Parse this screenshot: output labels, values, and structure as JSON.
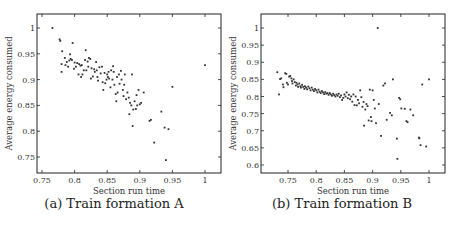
{
  "figure": {
    "captions": [
      "(a) Train formation A",
      "(b) Train formation B"
    ]
  },
  "chart_data": [
    {
      "type": "scatter",
      "title": "(a) Train formation A",
      "xlabel": "Section run time",
      "ylabel": "Average energy consumed",
      "xlim": [
        0.742,
        1.025
      ],
      "ylim": [
        0.72,
        1.027
      ],
      "xticks": [
        0.75,
        0.8,
        0.85,
        0.9,
        0.95,
        1
      ],
      "xtick_labels": [
        "0.75",
        "0.8",
        "0.85",
        "0.9",
        "0.95",
        "1"
      ],
      "yticks": [
        0.75,
        0.8,
        0.85,
        0.9,
        0.95,
        1
      ],
      "ytick_labels": [
        "0.75",
        "0.8",
        "0.85",
        "0.9",
        "0.95",
        "1"
      ],
      "grid": false,
      "legend": null,
      "frame": {
        "left": 37,
        "top": 14,
        "right": 221,
        "bottom": 173
      },
      "pixel_map": {
        "x0": 0.75,
        "px0": 42,
        "x1": 1.0,
        "px1": 205,
        "y0": 0.75,
        "py0": 157,
        "y1": 1.0,
        "py1": 28
      },
      "points": [
        [
          0.766,
          1.0
        ],
        [
          0.777,
          0.978
        ],
        [
          0.778,
          0.975
        ],
        [
          0.781,
          0.955
        ],
        [
          0.78,
          0.93
        ],
        [
          0.78,
          0.915
        ],
        [
          0.785,
          0.942
        ],
        [
          0.786,
          0.928
        ],
        [
          0.788,
          0.934
        ],
        [
          0.79,
          0.925
        ],
        [
          0.792,
          0.937
        ],
        [
          0.793,
          0.949
        ],
        [
          0.794,
          0.94
        ],
        [
          0.796,
          0.938
        ],
        [
          0.797,
          0.971
        ],
        [
          0.799,
          0.921
        ],
        [
          0.8,
          0.933
        ],
        [
          0.802,
          0.925
        ],
        [
          0.804,
          0.932
        ],
        [
          0.806,
          0.91
        ],
        [
          0.807,
          0.93
        ],
        [
          0.809,
          0.927
        ],
        [
          0.81,
          0.905
        ],
        [
          0.811,
          0.928
        ],
        [
          0.812,
          0.91
        ],
        [
          0.814,
          0.918
        ],
        [
          0.816,
          0.938
        ],
        [
          0.817,
          0.957
        ],
        [
          0.818,
          0.918
        ],
        [
          0.82,
          0.935
        ],
        [
          0.821,
          0.925
        ],
        [
          0.822,
          0.942
        ],
        [
          0.824,
          0.94
        ],
        [
          0.825,
          0.902
        ],
        [
          0.826,
          0.922
        ],
        [
          0.828,
          0.906
        ],
        [
          0.83,
          0.92
        ],
        [
          0.831,
          0.915
        ],
        [
          0.833,
          0.934
        ],
        [
          0.834,
          0.918
        ],
        [
          0.835,
          0.905
        ],
        [
          0.836,
          0.898
        ],
        [
          0.838,
          0.924
        ],
        [
          0.84,
          0.912
        ],
        [
          0.842,
          0.925
        ],
        [
          0.843,
          0.895
        ],
        [
          0.844,
          0.88
        ],
        [
          0.846,
          0.913
        ],
        [
          0.847,
          0.893
        ],
        [
          0.849,
          0.9
        ],
        [
          0.85,
          0.91
        ],
        [
          0.851,
          0.905
        ],
        [
          0.852,
          0.915
        ],
        [
          0.853,
          0.902
        ],
        [
          0.855,
          0.885
        ],
        [
          0.856,
          0.918
        ],
        [
          0.858,
          0.9
        ],
        [
          0.859,
          0.926
        ],
        [
          0.86,
          0.915
        ],
        [
          0.861,
          0.89
        ],
        [
          0.863,
          0.872
        ],
        [
          0.864,
          0.858
        ],
        [
          0.865,
          0.905
        ],
        [
          0.866,
          0.875
        ],
        [
          0.868,
          0.91
        ],
        [
          0.869,
          0.892
        ],
        [
          0.871,
          0.917
        ],
        [
          0.872,
          0.9
        ],
        [
          0.874,
          0.88
        ],
        [
          0.875,
          0.868
        ],
        [
          0.876,
          0.89
        ],
        [
          0.877,
          0.91
        ],
        [
          0.879,
          0.862
        ],
        [
          0.881,
          0.875
        ],
        [
          0.883,
          0.865
        ],
        [
          0.884,
          0.833
        ],
        [
          0.885,
          0.855
        ],
        [
          0.887,
          0.85
        ],
        [
          0.888,
          0.91
        ],
        [
          0.889,
          0.81
        ],
        [
          0.89,
          0.842
        ],
        [
          0.892,
          0.858
        ],
        [
          0.894,
          0.843
        ],
        [
          0.895,
          0.87
        ],
        [
          0.896,
          0.85
        ],
        [
          0.898,
          0.88
        ],
        [
          0.9,
          0.852
        ],
        [
          0.902,
          0.855
        ],
        [
          0.906,
          0.875
        ],
        [
          0.915,
          0.82
        ],
        [
          0.917,
          0.822
        ],
        [
          0.922,
          0.778
        ],
        [
          0.933,
          0.838
        ],
        [
          0.938,
          0.807
        ],
        [
          0.94,
          0.744
        ],
        [
          0.944,
          0.804
        ],
        [
          0.95,
          0.886
        ],
        [
          1.0,
          0.928
        ]
      ]
    },
    {
      "type": "scatter",
      "title": "(b) Train formation B",
      "xlabel": "Section run time",
      "ylabel": "Average energy consumed",
      "xlim": [
        0.702,
        1.028
      ],
      "ylim": [
        0.58,
        1.04
      ],
      "xticks": [
        0.75,
        0.8,
        0.85,
        0.9,
        0.95,
        1
      ],
      "xtick_labels": [
        "0.75",
        "0.8",
        "0.85",
        "0.9",
        "0.95",
        "1"
      ],
      "yticks": [
        0.6,
        0.65,
        0.7,
        0.75,
        0.8,
        0.85,
        0.9,
        0.95,
        1
      ],
      "ytick_labels": [
        "0.6",
        "0.65",
        "0.7",
        "0.75",
        "0.8",
        "0.85",
        "0.9",
        "0.95",
        "1"
      ],
      "grid": false,
      "legend": null,
      "frame": {
        "left": 261,
        "top": 14,
        "right": 445,
        "bottom": 173
      },
      "pixel_map": {
        "x0": 0.75,
        "px0": 288,
        "x1": 1.0,
        "px1": 429,
        "y0": 0.6,
        "py0": 165,
        "y1": 1.0,
        "py1": 28
      },
      "points": [
        [
          0.731,
          0.871
        ],
        [
          0.734,
          0.806
        ],
        [
          0.736,
          0.851
        ],
        [
          0.738,
          0.853
        ],
        [
          0.741,
          0.835
        ],
        [
          0.742,
          0.827
        ],
        [
          0.745,
          0.868
        ],
        [
          0.747,
          0.866
        ],
        [
          0.748,
          0.84
        ],
        [
          0.75,
          0.835
        ],
        [
          0.752,
          0.858
        ],
        [
          0.754,
          0.86
        ],
        [
          0.756,
          0.853
        ],
        [
          0.757,
          0.845
        ],
        [
          0.758,
          0.838
        ],
        [
          0.76,
          0.85
        ],
        [
          0.762,
          0.842
        ],
        [
          0.764,
          0.832
        ],
        [
          0.765,
          0.84
        ],
        [
          0.767,
          0.835
        ],
        [
          0.768,
          0.828
        ],
        [
          0.77,
          0.838
        ],
        [
          0.772,
          0.83
        ],
        [
          0.773,
          0.826
        ],
        [
          0.775,
          0.834
        ],
        [
          0.777,
          0.828
        ],
        [
          0.779,
          0.822
        ],
        [
          0.78,
          0.83
        ],
        [
          0.782,
          0.826
        ],
        [
          0.784,
          0.821
        ],
        [
          0.786,
          0.829
        ],
        [
          0.788,
          0.824
        ],
        [
          0.79,
          0.818
        ],
        [
          0.792,
          0.826
        ],
        [
          0.794,
          0.82
        ],
        [
          0.796,
          0.816
        ],
        [
          0.798,
          0.822
        ],
        [
          0.8,
          0.818
        ],
        [
          0.802,
          0.812
        ],
        [
          0.804,
          0.82
        ],
        [
          0.806,
          0.814
        ],
        [
          0.808,
          0.81
        ],
        [
          0.81,
          0.816
        ],
        [
          0.812,
          0.812
        ],
        [
          0.814,
          0.807
        ],
        [
          0.816,
          0.813
        ],
        [
          0.818,
          0.808
        ],
        [
          0.82,
          0.81
        ],
        [
          0.822,
          0.805
        ],
        [
          0.824,
          0.81
        ],
        [
          0.826,
          0.806
        ],
        [
          0.828,
          0.802
        ],
        [
          0.83,
          0.808
        ],
        [
          0.832,
          0.804
        ],
        [
          0.834,
          0.8
        ],
        [
          0.836,
          0.806
        ],
        [
          0.838,
          0.802
        ],
        [
          0.84,
          0.808
        ],
        [
          0.842,
          0.798
        ],
        [
          0.844,
          0.803
        ],
        [
          0.846,
          0.79
        ],
        [
          0.848,
          0.796
        ],
        [
          0.85,
          0.806
        ],
        [
          0.852,
          0.8
        ],
        [
          0.854,
          0.812
        ],
        [
          0.856,
          0.795
        ],
        [
          0.858,
          0.805
        ],
        [
          0.86,
          0.792
        ],
        [
          0.862,
          0.8
        ],
        [
          0.864,
          0.785
        ],
        [
          0.866,
          0.806
        ],
        [
          0.868,
          0.775
        ],
        [
          0.87,
          0.8
        ],
        [
          0.872,
          0.774
        ],
        [
          0.874,
          0.79
        ],
        [
          0.876,
          0.78
        ],
        [
          0.878,
          0.818
        ],
        [
          0.88,
          0.798
        ],
        [
          0.882,
          0.77
        ],
        [
          0.884,
          0.784
        ],
        [
          0.885,
          0.715
        ],
        [
          0.887,
          0.762
        ],
        [
          0.889,
          0.778
        ],
        [
          0.891,
          0.772
        ],
        [
          0.893,
          0.73
        ],
        [
          0.895,
          0.82
        ],
        [
          0.897,
          0.74
        ],
        [
          0.898,
          0.728
        ],
        [
          0.9,
          0.818
        ],
        [
          0.902,
          0.79
        ],
        [
          0.904,
          0.765
        ],
        [
          0.906,
          0.722
        ],
        [
          0.909,
          1.0
        ],
        [
          0.911,
          0.778
        ],
        [
          0.915,
          0.685
        ],
        [
          0.919,
          0.832
        ],
        [
          0.922,
          0.838
        ],
        [
          0.925,
          0.732
        ],
        [
          0.931,
          0.752
        ],
        [
          0.934,
          0.745
        ],
        [
          0.936,
          0.85
        ],
        [
          0.943,
          0.677
        ],
        [
          0.944,
          0.618
        ],
        [
          0.947,
          0.796
        ],
        [
          0.949,
          0.792
        ],
        [
          0.951,
          0.765
        ],
        [
          0.957,
          0.764
        ],
        [
          0.96,
          0.728
        ],
        [
          0.962,
          0.725
        ],
        [
          0.967,
          0.762
        ],
        [
          0.972,
          0.745
        ],
        [
          0.982,
          0.68
        ],
        [
          0.983,
          0.678
        ],
        [
          0.985,
          0.658
        ],
        [
          0.988,
          0.835
        ],
        [
          0.995,
          0.654
        ],
        [
          1.0,
          0.85
        ]
      ]
    }
  ]
}
